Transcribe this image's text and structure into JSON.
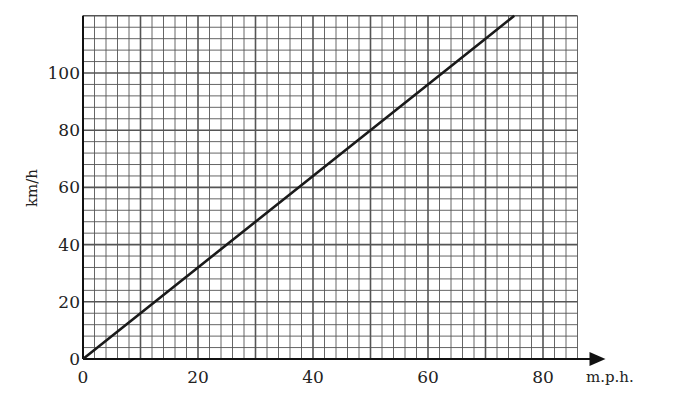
{
  "chart_data": {
    "type": "line",
    "title": "",
    "xlabel": "m.p.h.",
    "ylabel": "km/h",
    "xlim": [
      0,
      86
    ],
    "ylim": [
      0,
      120
    ],
    "x_ticks": [
      0,
      20,
      40,
      60,
      80
    ],
    "y_ticks": [
      0,
      20,
      40,
      60,
      80,
      100
    ],
    "grid": {
      "on": true,
      "minor_x_step": 2,
      "minor_y_step": 4,
      "major_x_step": 10,
      "major_y_step": 20
    },
    "series": [
      {
        "name": "mph to km/h conversion",
        "x": [
          0,
          10,
          20,
          30,
          40,
          50,
          60,
          70,
          75
        ],
        "y": [
          0,
          16,
          32,
          48,
          64,
          80,
          96,
          112,
          120
        ]
      }
    ],
    "legend": null
  },
  "colors": {
    "line": "#1a1a1a",
    "grid": "#555555",
    "background": "#ffffff"
  }
}
